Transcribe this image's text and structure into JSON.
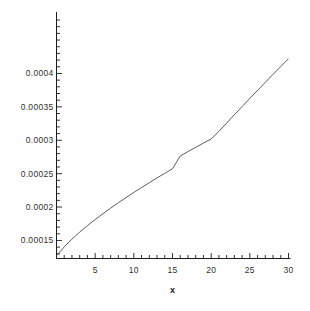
{
  "chart_data": {
    "type": "line",
    "title": "",
    "subtitle": "",
    "xlabel": "x",
    "ylabel": "",
    "xlim": [
      0,
      30
    ],
    "ylim": [
      0.000123,
      0.000483
    ],
    "grid": false,
    "legend": null,
    "background_color": "#ffffff",
    "line_color": "#4a4a4a",
    "axis_color": "#1c1c1c",
    "x_ticks": [
      {
        "value": 5,
        "label": "5"
      },
      {
        "value": 10,
        "label": "10"
      },
      {
        "value": 15,
        "label": "15"
      },
      {
        "value": 20,
        "label": "20"
      },
      {
        "value": 25,
        "label": "25"
      },
      {
        "value": 30,
        "label": "30"
      }
    ],
    "x_minor_tick_step": 1,
    "y_ticks": [
      {
        "value": 0.00015,
        "label": "0.00015"
      },
      {
        "value": 0.0002,
        "label": "0.0002"
      },
      {
        "value": 0.00025,
        "label": "0.00025"
      },
      {
        "value": 0.0003,
        "label": "0.0003"
      },
      {
        "value": 0.00035,
        "label": "0.00035"
      },
      {
        "value": 0.0004,
        "label": "0.0004"
      }
    ],
    "y_minor_tick_step": 1e-05,
    "series": [
      {
        "name": "curve",
        "x": [
          0,
          1,
          2,
          3,
          4,
          5,
          6,
          7,
          8,
          9,
          10,
          11,
          12,
          13,
          14,
          15,
          16,
          17,
          18,
          19,
          20,
          21,
          22,
          23,
          24,
          25,
          26,
          27,
          28,
          29,
          30
        ],
        "y": [
          0.000127,
          0.0001405,
          0.000152,
          0.0001625,
          0.0001722,
          0.0001813,
          0.00019,
          0.0001984,
          0.0002065,
          0.0002143,
          0.0002219,
          0.0002293,
          0.0002365,
          0.0002436,
          0.0002505,
          0.0002573,
          0.0002765,
          0.000283,
          0.0002894,
          0.0002957,
          0.0003019,
          0.0003133,
          0.0003257,
          0.0003381,
          0.0003504,
          0.0003626,
          0.0003747,
          0.0003867,
          0.0003986,
          0.0004104,
          0.0004221
        ]
      }
    ]
  }
}
